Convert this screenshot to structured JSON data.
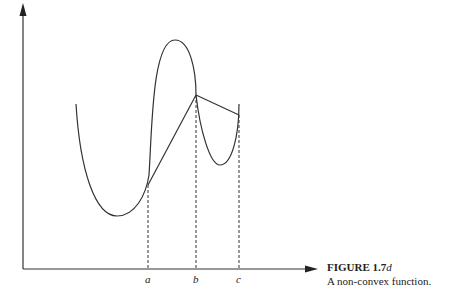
{
  "figure": {
    "caption_title": "FIGURE 1.7",
    "caption_title_suffix": "d",
    "caption_text": "A non-convex function."
  },
  "axes": {
    "x_labels": [
      {
        "key": "a",
        "text": "a"
      },
      {
        "key": "b",
        "text": "b"
      },
      {
        "key": "c",
        "text": "c"
      }
    ]
  },
  "diagram": {
    "curve": "non-convex function with two local minima and one local maximum",
    "chord_segments": [
      "a-b",
      "b-c"
    ],
    "dashed_verticals": [
      "a",
      "b",
      "c"
    ],
    "colors": {
      "line": "#333333",
      "background": "#ffffff"
    }
  }
}
